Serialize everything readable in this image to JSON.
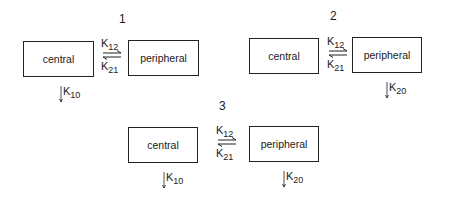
{
  "diagrams": [
    {
      "number": "1",
      "compartments": {
        "central": "central",
        "peripheral": "peripheral"
      },
      "transfer": {
        "forward": "K",
        "forward_sub": "12",
        "backward": "K",
        "backward_sub": "21"
      },
      "elimination": [
        {
          "from": "central",
          "label": "K",
          "sub": "10"
        }
      ]
    },
    {
      "number": "2",
      "compartments": {
        "central": "central",
        "peripheral": "peripheral"
      },
      "transfer": {
        "forward": "K",
        "forward_sub": "12",
        "backward": "K",
        "backward_sub": "21"
      },
      "elimination": [
        {
          "from": "peripheral",
          "label": "K",
          "sub": "20"
        }
      ]
    },
    {
      "number": "3",
      "compartments": {
        "central": "central",
        "peripheral": "peripheral"
      },
      "transfer": {
        "forward": "K",
        "forward_sub": "12",
        "backward": "K",
        "backward_sub": "21"
      },
      "elimination": [
        {
          "from": "central",
          "label": "K",
          "sub": "10"
        },
        {
          "from": "peripheral",
          "label": "K",
          "sub": "20"
        }
      ]
    }
  ],
  "colors": {
    "line": "#222222",
    "text": "#1a1a1a",
    "background": "#ffffff"
  }
}
